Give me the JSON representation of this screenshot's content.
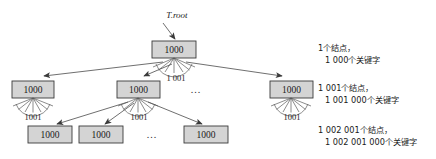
{
  "figure": {
    "title_label": "T.root",
    "ellipsis": "...",
    "node_value": "1000",
    "fan_count": "1 001"
  },
  "tree": {
    "levels": [
      {
        "level": 0,
        "nodes": [
          {
            "id": "root",
            "label": "1000",
            "x": 174,
            "y": 49.5,
            "fan": true,
            "fan_label": "1 001"
          }
        ]
      },
      {
        "level": 1,
        "nodes": [
          {
            "id": "n1",
            "label": "1000",
            "x": 32,
            "y": 90,
            "fan": true,
            "fan_label": "1001"
          },
          {
            "id": "n2",
            "label": "1000",
            "x": 138,
            "y": 90,
            "fan": true,
            "fan_label": "1001"
          },
          {
            "id": "n3",
            "label": "1000",
            "x": 291,
            "y": 90,
            "fan": true,
            "fan_label": "1001"
          }
        ],
        "ellipsis_x": 196,
        "ellipsis_y": 90
      },
      {
        "level": 2,
        "nodes": [
          {
            "id": "l1",
            "label": "1000",
            "x": 50,
            "y": 134
          },
          {
            "id": "l2",
            "label": "1000",
            "x": 101,
            "y": 134
          },
          {
            "id": "l3",
            "label": "1000",
            "x": 206,
            "y": 134
          }
        ],
        "ellipsis_x": 152,
        "ellipsis_y": 135
      }
    ]
  },
  "annotations": [
    {
      "id": "level-0",
      "line1": "1个结点，",
      "line2": "1 000个关键字"
    },
    {
      "id": "level-1",
      "line1": "1 001个结点，",
      "line2": "1 001 000个关键字"
    },
    {
      "id": "level-2",
      "line1": "1 002 001个结点，",
      "line2": "1 002 001 000个关键字"
    }
  ],
  "colors": {
    "node_fill": "#d4d4d4",
    "node_stroke": "#3a3a3a",
    "edge": "#4a4a4a",
    "text": "#1a1a1a",
    "background": "#ffffff"
  }
}
